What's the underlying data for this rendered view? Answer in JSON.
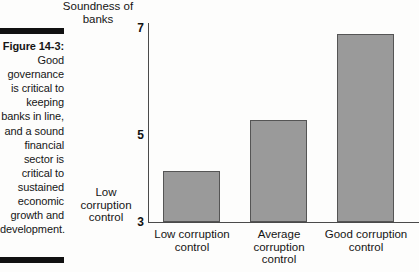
{
  "figure": {
    "label": "Figure 14-3:",
    "body": "Good governance is critical to keeping banks in line, and a sound financial sector is critical to sustained economic growth and development."
  },
  "chart_data": {
    "type": "bar",
    "title": "",
    "ylabel": "Soundness of banks",
    "ylabel_low": "Low corruption control",
    "xlabel": "",
    "categories": [
      "Low corruption control",
      "Average corruption control",
      "Good corruption control"
    ],
    "values": [
      4.05,
      5.1,
      6.85
    ],
    "ylim": [
      3,
      7
    ],
    "yticks": [
      3,
      5,
      7
    ],
    "ytick_labels": [
      "3",
      "5",
      "7"
    ],
    "grid": false,
    "legend": false,
    "bar_color": "#9a9a9a",
    "bar_border_color": "#555555",
    "axis_color": "#4a4a4a"
  }
}
